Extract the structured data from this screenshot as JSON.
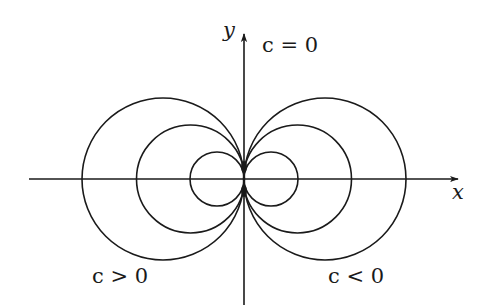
{
  "figure": {
    "type": "diagram",
    "axes": {
      "x_label": "x",
      "y_label": "y"
    },
    "annotations": {
      "top": "c = 0",
      "bottom_left": "c > 0",
      "bottom_right": "c < 0"
    },
    "colors": {
      "stroke": "#1a1a1a",
      "background": "#ffffff"
    }
  },
  "geometry": {
    "origin": [
      244,
      179
    ],
    "x_axis": {
      "from": 29,
      "to": 460
    },
    "y_axis": {
      "from": 305,
      "to": 32
    },
    "left_circles": [
      {
        "cx": 163,
        "cy": 179,
        "r": 81
      },
      {
        "cx": 190.5,
        "cy": 179,
        "r": 54
      },
      {
        "cx": 217,
        "cy": 179,
        "r": 27
      }
    ],
    "right_circles": [
      {
        "cx": 325,
        "cy": 179,
        "r": 81
      },
      {
        "cx": 297.5,
        "cy": 179,
        "r": 54
      },
      {
        "cx": 271,
        "cy": 179,
        "r": 27
      }
    ]
  }
}
